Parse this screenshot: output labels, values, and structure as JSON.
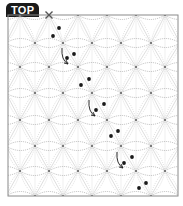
{
  "badge": {
    "label": "TOP"
  },
  "diagram": {
    "frame": {
      "x": 8,
      "y": 15,
      "width": 170,
      "height": 181,
      "color": "#8a8a8a"
    },
    "grid_line_color": "#c8c8c8",
    "stitch_color": "#8f8f8f",
    "dot_color": "#1a1a1a",
    "node_rows": [
      {
        "y": 15,
        "xs": [
          20,
          49,
          78,
          107,
          136,
          165
        ]
      },
      {
        "y": 43,
        "xs": [
          35,
          63,
          92,
          121,
          151
        ]
      },
      {
        "y": 67,
        "xs": [
          20,
          49,
          78,
          107,
          136,
          165
        ]
      },
      {
        "y": 93,
        "xs": [
          35,
          63,
          92,
          121,
          151
        ]
      },
      {
        "y": 120,
        "xs": [
          20,
          49,
          78,
          107,
          136,
          165
        ]
      },
      {
        "y": 146,
        "xs": [
          35,
          63,
          92,
          121,
          151
        ]
      },
      {
        "y": 171,
        "xs": [
          20,
          49,
          78,
          107,
          136,
          165
        ]
      },
      {
        "y": 196,
        "xs": [
          35,
          63,
          92,
          121,
          151
        ]
      }
    ],
    "start_marker": {
      "x": 49,
      "y": 15,
      "symbol": "x-mark"
    },
    "dots": [
      [
        59,
        28
      ],
      [
        53,
        36
      ],
      [
        74,
        54
      ],
      [
        67,
        58
      ],
      [
        89,
        79
      ],
      [
        81,
        85
      ],
      [
        104,
        104
      ],
      [
        96,
        110
      ],
      [
        118,
        131
      ],
      [
        111,
        136
      ],
      [
        132,
        157
      ],
      [
        124,
        163
      ],
      [
        146,
        183
      ],
      [
        139,
        188
      ]
    ],
    "arrows": [
      {
        "from": [
          62,
          48
        ],
        "to": [
          68,
          64
        ]
      },
      {
        "from": [
          89,
          100
        ],
        "to": [
          95,
          116
        ]
      },
      {
        "from": [
          117,
          152
        ],
        "to": [
          123,
          168
        ]
      }
    ]
  }
}
